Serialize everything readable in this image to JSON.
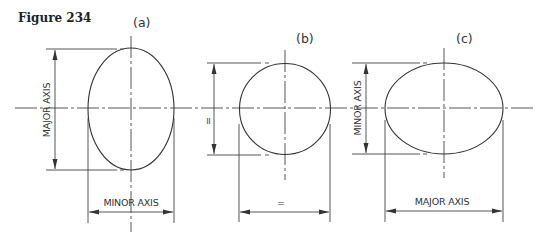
{
  "figure": {
    "title": "Figure 234"
  },
  "views": [
    {
      "id": "a",
      "label": "(a)",
      "shape": "ellipse (vertical)",
      "vertical_dimension_label": "MAJOR AXIS",
      "horizontal_dimension_label": "MINOR AXIS"
    },
    {
      "id": "b",
      "label": "(b)",
      "shape": "circle",
      "vertical_dimension_label": "=",
      "horizontal_dimension_label": "="
    },
    {
      "id": "c",
      "label": "(c)",
      "shape": "ellipse (horizontal)",
      "vertical_dimension_label": "MINOR AXIS",
      "horizontal_dimension_label": "MAJOR AXIS"
    }
  ],
  "colors": {
    "line": "#444444",
    "background": "#ffffff"
  }
}
